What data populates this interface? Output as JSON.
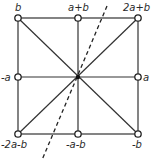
{
  "diagram": {
    "type": "lattice-square",
    "nodes": [
      {
        "id": "tl",
        "label": "b",
        "x": 18,
        "y": 18
      },
      {
        "id": "tc",
        "label": "a+b",
        "x": 78,
        "y": 18
      },
      {
        "id": "tr",
        "label": "2a+b",
        "x": 138,
        "y": 18
      },
      {
        "id": "ml",
        "label": "-a",
        "x": 18,
        "y": 77
      },
      {
        "id": "mr",
        "label": "a",
        "x": 138,
        "y": 77
      },
      {
        "id": "bl",
        "label": "-2a-b",
        "x": 18,
        "y": 134
      },
      {
        "id": "bc",
        "label": "-a-b",
        "x": 78,
        "y": 134
      },
      {
        "id": "br",
        "label": "-b",
        "x": 138,
        "y": 134
      }
    ],
    "center": {
      "x": 78,
      "y": 77
    },
    "dashed_axis": {
      "from": [
        107,
        6
      ],
      "to": [
        42,
        160
      ]
    },
    "stroke_color": "#333333"
  }
}
